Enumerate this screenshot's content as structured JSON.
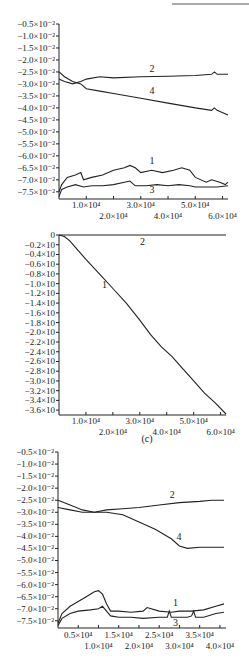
{
  "chart_data": [
    {
      "type": "line",
      "panel": "a",
      "title": "",
      "xlabel": "",
      "ylabel": "",
      "xlim": [
        0,
        62000
      ],
      "ylim": [
        -0.078,
        -0.005
      ],
      "yticks": [
        -0.005,
        -0.01,
        -0.015,
        -0.02,
        -0.025,
        -0.03,
        -0.035,
        -0.04,
        -0.045,
        -0.05,
        -0.055,
        -0.06,
        -0.065,
        -0.07,
        -0.075
      ],
      "ytick_labels": [
        "−0.5×10⁻²",
        "−1.0×10⁻²",
        "−1.5×10⁻²",
        "−2.0×10⁻²",
        "−2.5×10⁻²",
        "−3.0×10⁻²",
        "−3.5×10⁻²",
        "−4.0×10⁻²",
        "−4.5×10⁻²",
        "−5.0×10⁻²",
        "−5.5×10⁻²",
        "−6.0×10⁻²",
        "−6.5×10⁻²",
        "−7.0×10⁻²",
        "−7.5×10⁻²"
      ],
      "xticks": [
        10000,
        20000,
        30000,
        40000,
        50000,
        60000
      ],
      "xtick_labels": [
        "1.0×10⁴",
        "2.0×10⁴",
        "3.0×10⁴",
        "4.0×10⁴",
        "5.0×10⁴",
        "6.0×10⁴"
      ],
      "grid": false,
      "series": [
        {
          "name": "1",
          "x": [
            0,
            1000,
            3000,
            6000,
            8000,
            9000,
            12000,
            16000,
            20000,
            24000,
            26000,
            28000,
            30000,
            34000,
            38000,
            42000,
            45000,
            48000,
            50000,
            54000,
            56000,
            59000,
            61000,
            62000
          ],
          "y": [
            -0.075,
            -0.072,
            -0.069,
            -0.068,
            -0.067,
            -0.07,
            -0.069,
            -0.068,
            -0.066,
            -0.065,
            -0.064,
            -0.065,
            -0.067,
            -0.066,
            -0.067,
            -0.066,
            -0.065,
            -0.066,
            -0.069,
            -0.071,
            -0.07,
            -0.071,
            -0.072,
            -0.071
          ]
        },
        {
          "name": "2",
          "x": [
            0,
            2000,
            5000,
            8000,
            10000,
            15000,
            20000,
            30000,
            40000,
            50000,
            56000,
            57000,
            58000,
            62000
          ],
          "y": [
            -0.028,
            -0.029,
            -0.03,
            -0.029,
            -0.028,
            -0.027,
            -0.0275,
            -0.027,
            -0.0268,
            -0.0265,
            -0.026,
            -0.025,
            -0.026,
            -0.026
          ]
        },
        {
          "name": "3",
          "x": [
            0,
            1000,
            3000,
            6000,
            9000,
            12000,
            16000,
            20000,
            24000,
            26000,
            28000,
            32000,
            36000,
            40000,
            44000,
            48000,
            50000,
            54000,
            58000,
            62000
          ],
          "y": [
            -0.077,
            -0.074,
            -0.073,
            -0.072,
            -0.073,
            -0.0725,
            -0.0725,
            -0.072,
            -0.071,
            -0.0705,
            -0.0725,
            -0.0725,
            -0.072,
            -0.0725,
            -0.072,
            -0.0725,
            -0.073,
            -0.073,
            -0.073,
            -0.0725
          ]
        },
        {
          "name": "4",
          "x": [
            0,
            2000,
            5000,
            8000,
            10000,
            15000,
            20000,
            30000,
            40000,
            50000,
            56000,
            57000,
            58000,
            62000
          ],
          "y": [
            -0.025,
            -0.027,
            -0.029,
            -0.03,
            -0.032,
            -0.033,
            -0.034,
            -0.036,
            -0.038,
            -0.04,
            -0.041,
            -0.04,
            -0.041,
            -0.043
          ]
        }
      ]
    },
    {
      "type": "line",
      "panel": "c",
      "title": "(c)",
      "xlabel": "",
      "ylabel": "",
      "xlim": [
        0,
        62000
      ],
      "ylim": [
        -0.37,
        0
      ],
      "yticks": [
        0,
        -0.02,
        -0.04,
        -0.06,
        -0.08,
        -0.1,
        -0.12,
        -0.14,
        -0.16,
        -0.18,
        -0.2,
        -0.22,
        -0.24,
        -0.26,
        -0.28,
        -0.3,
        -0.32,
        -0.34,
        -0.36
      ],
      "ytick_labels": [
        "0",
        "−0.2×10",
        "−0.4×10",
        "−0.6×10",
        "−0.8×10",
        "−1.0×10",
        "−1.2×10",
        "−1.4×10",
        "−1.6×10",
        "−1.8×10",
        "−2.0×10",
        "−2.2×10",
        "−2.4×10",
        "−2.6×10",
        "−2.8×10",
        "−3.0×10",
        "−3.2×10",
        "−3.4×10",
        "−3.6×10"
      ],
      "xticks": [
        10000,
        20000,
        30000,
        40000,
        50000,
        60000
      ],
      "xtick_labels": [
        "1.0×10⁴",
        "2.0×10⁴",
        "3.0×10⁴",
        "4.0×10⁴",
        "5.0×10⁴",
        "6.0×10⁴"
      ],
      "grid": false,
      "series": [
        {
          "name": "1",
          "x": [
            0,
            2000,
            4000,
            6000,
            10000,
            15000,
            20000,
            25000,
            30000,
            34000,
            38000,
            42000,
            46000,
            50000,
            54000,
            58000,
            62000
          ],
          "y": [
            0,
            -0.003,
            -0.012,
            -0.025,
            -0.05,
            -0.08,
            -0.11,
            -0.14,
            -0.175,
            -0.205,
            -0.23,
            -0.25,
            -0.275,
            -0.3,
            -0.325,
            -0.345,
            -0.368
          ]
        },
        {
          "name": "2",
          "x": [
            0,
            62000
          ],
          "y": [
            0,
            0
          ]
        }
      ]
    },
    {
      "type": "line",
      "panel": "d",
      "title": "",
      "xlabel": "",
      "ylabel": "",
      "xlim": [
        0,
        41500
      ],
      "ylim": [
        -0.078,
        -0.005
      ],
      "yticks": [
        -0.005,
        -0.01,
        -0.015,
        -0.02,
        -0.025,
        -0.03,
        -0.035,
        -0.04,
        -0.045,
        -0.05,
        -0.055,
        -0.06,
        -0.065,
        -0.07,
        -0.075
      ],
      "ytick_labels": [
        "−0.5×10⁻²",
        "−1.0×10⁻²",
        "−1.5×10⁻²",
        "−2.0×10⁻²",
        "−2.5×10⁻²",
        "−3.0×10⁻²",
        "−3.5×10⁻²",
        "−4.0×10⁻²",
        "−4.5×10⁻²",
        "−5.0×10⁻²",
        "−5.5×10⁻²",
        "−6.0×10⁻²",
        "−6.5×10⁻²",
        "−7.0×10⁻²",
        "−7.5×10⁻²"
      ],
      "xticks": [
        5000,
        10000,
        15000,
        20000,
        25000,
        30000,
        35000,
        40000
      ],
      "xtick_labels": [
        "0.5×10⁴",
        "1.0×10⁴",
        "1.5×10⁴",
        "2.0×10⁴",
        "2.5×10⁴",
        "3.0×10⁴",
        "3.5×10⁴",
        "4.0×10⁴"
      ],
      "grid": false,
      "series": [
        {
          "name": "1",
          "x": [
            0,
            1000,
            3000,
            5000,
            7000,
            9000,
            10000,
            11000,
            12000,
            13000,
            15000,
            18000,
            21000,
            22000,
            25000,
            28000,
            30000,
            33000,
            36000,
            39000,
            41000
          ],
          "y": [
            -0.076,
            -0.072,
            -0.069,
            -0.067,
            -0.065,
            -0.063,
            -0.0625,
            -0.064,
            -0.068,
            -0.071,
            -0.071,
            -0.0715,
            -0.071,
            -0.0695,
            -0.071,
            -0.0715,
            -0.071,
            -0.071,
            -0.0705,
            -0.069,
            -0.068
          ]
        },
        {
          "name": "2",
          "x": [
            0,
            3000,
            6000,
            9000,
            12000,
            16000,
            20000,
            25000,
            30000,
            35000,
            38000,
            41000
          ],
          "y": [
            -0.028,
            -0.029,
            -0.03,
            -0.03,
            -0.029,
            -0.0285,
            -0.028,
            -0.027,
            -0.026,
            -0.0255,
            -0.025,
            -0.025
          ]
        },
        {
          "name": "3",
          "x": [
            0,
            1000,
            3000,
            5000,
            8000,
            10000,
            11000,
            12000,
            13000,
            15000,
            18000,
            21000,
            25000,
            27000,
            27500,
            28000,
            30000,
            32000,
            33000,
            33500,
            34000,
            36000,
            39000,
            41000
          ],
          "y": [
            -0.077,
            -0.074,
            -0.072,
            -0.071,
            -0.0705,
            -0.07,
            -0.069,
            -0.071,
            -0.073,
            -0.0735,
            -0.0735,
            -0.074,
            -0.0735,
            -0.0735,
            -0.071,
            -0.0735,
            -0.0735,
            -0.0735,
            -0.073,
            -0.071,
            -0.0735,
            -0.0735,
            -0.072,
            -0.0715
          ]
        },
        {
          "name": "4",
          "x": [
            0,
            3000,
            6000,
            9000,
            12000,
            16000,
            20000,
            24000,
            28000,
            30000,
            32000,
            35000,
            38000,
            41000
          ],
          "y": [
            -0.025,
            -0.027,
            -0.029,
            -0.03,
            -0.03,
            -0.031,
            -0.034,
            -0.037,
            -0.041,
            -0.044,
            -0.045,
            -0.0445,
            -0.0445,
            -0.0445
          ]
        }
      ]
    }
  ],
  "decorations": {
    "top_rule": true
  }
}
